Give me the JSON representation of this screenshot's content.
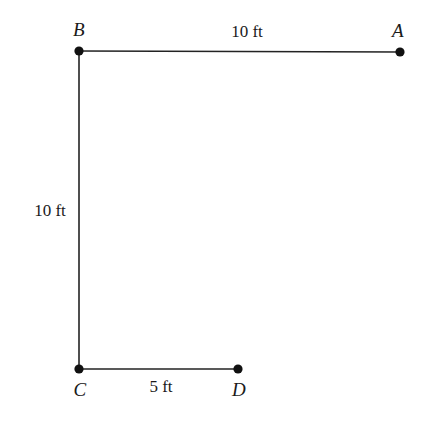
{
  "figure": {
    "type": "geometry-diagram",
    "background_color": "#ffffff",
    "stroke_color": "#232323",
    "stroke_width": 1.6,
    "vertex_dot_color": "#111111",
    "vertex_dot_radius": 4.6,
    "width": 435,
    "height": 426,
    "vertices": [
      {
        "id": "A",
        "label": "A",
        "x": 400,
        "y": 52,
        "label_x": 398,
        "label_y": 30
      },
      {
        "id": "B",
        "label": "B",
        "x": 79,
        "y": 51,
        "label_x": 79,
        "label_y": 29
      },
      {
        "id": "C",
        "label": "C",
        "x": 79,
        "y": 369,
        "label_x": 80,
        "label_y": 389
      },
      {
        "id": "D",
        "label": "D",
        "x": 238,
        "y": 369,
        "label_x": 239,
        "label_y": 389
      }
    ],
    "edges": [
      {
        "id": "BA",
        "from": "B",
        "to": "A",
        "x1": 79,
        "y1": 51,
        "x2": 400,
        "y2": 52
      },
      {
        "id": "BC",
        "from": "B",
        "to": "C",
        "x1": 79,
        "y1": 51,
        "x2": 79,
        "y2": 369
      },
      {
        "id": "CD",
        "from": "C",
        "to": "D",
        "x1": 79,
        "y1": 369,
        "x2": 238,
        "y2": 369
      }
    ],
    "edge_labels": [
      {
        "id": "BA",
        "text": "10 ft",
        "x": 247,
        "y": 31
      },
      {
        "id": "BC",
        "text": "10 ft",
        "x": 50,
        "y": 210
      },
      {
        "id": "CD",
        "text": "5 ft",
        "x": 161,
        "y": 386
      }
    ]
  }
}
